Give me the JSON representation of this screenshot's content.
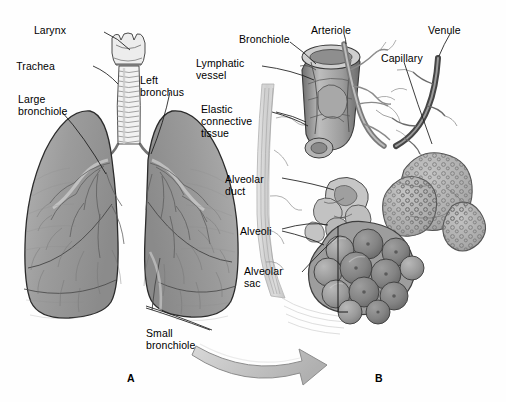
{
  "figure": {
    "style": "grayscale medical illustration",
    "background_color": "#fefefe",
    "ink_color": "#000000"
  },
  "panels": [
    {
      "id": "A",
      "letter": "A",
      "caption": "Lungs, trachea and bronchial tree",
      "x": 127,
      "y": 372
    },
    {
      "id": "B",
      "letter": "B",
      "caption": "Detail of respiratory bronchiole and alveoli",
      "x": 375,
      "y": 372
    }
  ],
  "labels": [
    {
      "name": "larynx",
      "text": "Larynx",
      "x": 66,
      "y": 24,
      "align": "right",
      "w": 60
    },
    {
      "name": "trachea",
      "text": "Trachea",
      "x": 55,
      "y": 60,
      "align": "right",
      "w": 60
    },
    {
      "name": "large-bronchiole",
      "text": "Large\nbronchiole",
      "x": 18,
      "y": 93,
      "align": "left",
      "w": 70
    },
    {
      "name": "left-bronchus",
      "text": "Left\nbronchus",
      "x": 140,
      "y": 74,
      "align": "left",
      "w": 62
    },
    {
      "name": "small-bronchiole",
      "text": "Small\nbronchiole",
      "x": 146,
      "y": 327,
      "align": "left",
      "w": 66
    },
    {
      "name": "bronchiole",
      "text": "Bronchiole",
      "x": 239,
      "y": 33,
      "align": "left",
      "w": 60
    },
    {
      "name": "arteriole",
      "text": "Arteriole",
      "x": 311,
      "y": 24,
      "align": "left",
      "w": 55
    },
    {
      "name": "venule",
      "text": "Venule",
      "x": 428,
      "y": 24,
      "align": "left",
      "w": 46
    },
    {
      "name": "capillary",
      "text": "Capillary",
      "x": 381,
      "y": 52,
      "align": "left",
      "w": 52
    },
    {
      "name": "lymphatic-vessel",
      "text": "Lymphatic\nvessel",
      "x": 196,
      "y": 57,
      "align": "left",
      "w": 66
    },
    {
      "name": "elastic-connective-tissue",
      "text": "Elastic\nconnective\ntissue",
      "x": 201,
      "y": 103,
      "align": "left",
      "w": 70
    },
    {
      "name": "alveolar-duct",
      "text": "Alveolar\nduct",
      "x": 225,
      "y": 173,
      "align": "left",
      "w": 56
    },
    {
      "name": "alveoli",
      "text": "Alveoli",
      "x": 240,
      "y": 225,
      "align": "left",
      "w": 42
    },
    {
      "name": "alveolar-sac",
      "text": "Alveolar\nsac",
      "x": 244,
      "y": 265,
      "align": "left",
      "w": 58
    }
  ],
  "structures": {
    "lungs": {
      "count": 2,
      "fill": "#9a9a9a",
      "outline": "#2b2b2b"
    },
    "trachea": {
      "rings": 16,
      "fill": "#f2f2f2"
    },
    "larynx": {
      "fill": "#ededed"
    },
    "alveolar_clusters": [
      {
        "name": "alveolar-sac-cluster",
        "texture": "smooth-grapes",
        "fill": "#8f8f8f"
      },
      {
        "name": "capillary-covered-cluster",
        "texture": "stippled",
        "fill": "#a8a8a8"
      }
    ],
    "vessels": {
      "arteriole": {
        "shade": "#8a8a8a"
      },
      "venule": {
        "shade": "#555555"
      },
      "capillary": {
        "shade": "#9e9e9e"
      }
    },
    "transition_arrow": {
      "name": "zoom-arrow",
      "direction": "from panel A small bronchiole to panel B",
      "fill": "#c9c9c9",
      "outline": "#8c8c8c"
    }
  }
}
